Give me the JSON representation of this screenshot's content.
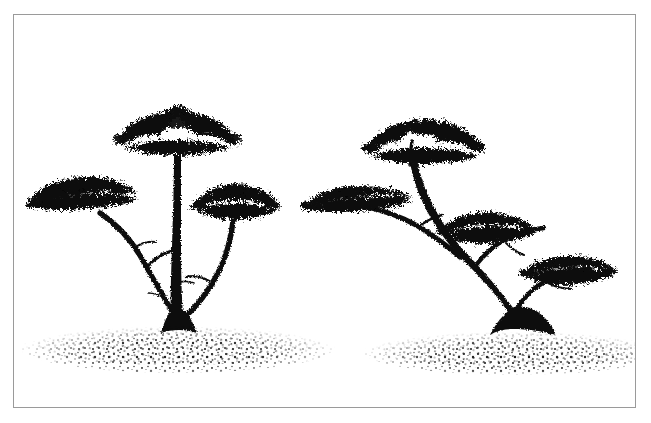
{
  "figure": {
    "kind": "line-illustration",
    "title": "Two savanna acacia trees",
    "caption": "",
    "background_color": "#ffffff",
    "ink_color": "#0d0d0d",
    "border": {
      "color": "#9a9a9a",
      "style": "thin-rectangle",
      "left": 13,
      "top": 14,
      "width": 623,
      "height": 394,
      "thickness_px": 1
    },
    "canvas": {
      "width": 651,
      "height": 423
    }
  },
  "subjects": [
    {
      "id": "tree-left",
      "label": "Left tree",
      "description": "Upright acacia with a tall straight central trunk and two lower side limbs, three flat umbrella canopies",
      "trunk_base_x": 163,
      "ground_line_y": 318,
      "canopies": [
        {
          "id": "canopy-top-left-tree",
          "label": "Top canopy",
          "cx": 163,
          "cy": 118,
          "rx": 58,
          "ry": 22
        },
        {
          "id": "canopy-left-left-tree",
          "label": "Left canopy",
          "cx": 68,
          "cy": 184,
          "rx": 58,
          "ry": 18
        },
        {
          "id": "canopy-right-left-tree",
          "label": "Right canopy",
          "cx": 222,
          "cy": 190,
          "rx": 45,
          "ry": 17
        }
      ]
    },
    {
      "id": "tree-right",
      "label": "Right tree",
      "description": "Leaning acacia whose trunk sweeps up-left from a gnarled root base, with four stacked flat canopies descending to the right",
      "trunk_base_x": 504,
      "ground_line_y": 322,
      "canopies": [
        {
          "id": "canopy-top-right-tree",
          "label": "Top canopy",
          "cx": 410,
          "cy": 126,
          "rx": 58,
          "ry": 22
        },
        {
          "id": "canopy-upper-left-right-tree",
          "label": "Upper left canopy",
          "cx": 348,
          "cy": 188,
          "rx": 58,
          "ry": 15
        },
        {
          "id": "canopy-mid-right-tree",
          "label": "Middle canopy",
          "cx": 473,
          "cy": 215,
          "rx": 48,
          "ry": 15
        },
        {
          "id": "canopy-low-right-tree",
          "label": "Lower right canopy",
          "cx": 552,
          "cy": 258,
          "rx": 45,
          "ry": 14
        }
      ]
    }
  ],
  "ground": [
    {
      "id": "ground-left",
      "label": "Left stippled ground mound",
      "cx": 163,
      "cy": 332,
      "rx": 155,
      "ry": 20
    },
    {
      "id": "ground-right",
      "label": "Right stippled ground mound",
      "cx": 500,
      "cy": 336,
      "rx": 150,
      "ry": 18
    }
  ],
  "legend": {
    "items": []
  },
  "annotations": []
}
